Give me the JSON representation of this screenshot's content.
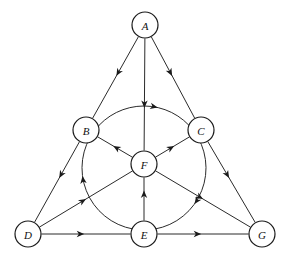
{
  "figure": {
    "background_color": "#ffffff",
    "line_color": "#2b2b2b",
    "node_fill": "#ffffff",
    "node_stroke": "#1a1a1a",
    "arrow_color": "#1a1a1a",
    "width": 287,
    "height": 257
  },
  "nodes": [
    {
      "id": "A",
      "label": "A",
      "x": 145,
      "y": 25,
      "r": 13
    },
    {
      "id": "B",
      "label": "B",
      "x": 86,
      "y": 130,
      "r": 13
    },
    {
      "id": "C",
      "label": "C",
      "x": 201,
      "y": 130,
      "r": 13
    },
    {
      "id": "F",
      "label": "F",
      "x": 144,
      "y": 164,
      "r": 13
    },
    {
      "id": "D",
      "label": "D",
      "x": 28,
      "y": 234,
      "r": 13
    },
    {
      "id": "E",
      "label": "E",
      "x": 144,
      "y": 234,
      "r": 13
    },
    {
      "id": "G",
      "label": "G",
      "x": 262,
      "y": 234,
      "r": 13
    }
  ],
  "edges": [
    {
      "id": "A-B",
      "from": "A",
      "to": "B",
      "kind": "straight",
      "arrow_t": 0.48
    },
    {
      "id": "A-C",
      "from": "A",
      "to": "C",
      "kind": "straight",
      "arrow_t": 0.48
    },
    {
      "id": "A-F",
      "from": "A",
      "to": "F",
      "kind": "straight",
      "arrow_t": 0.62
    },
    {
      "id": "B-D",
      "from": "B",
      "to": "D",
      "kind": "straight",
      "arrow_t": 0.45
    },
    {
      "id": "F-B",
      "from": "F",
      "to": "B",
      "kind": "straight",
      "arrow_t": 0.55
    },
    {
      "id": "F-C",
      "from": "F",
      "to": "C",
      "kind": "straight",
      "arrow_t": 0.55
    },
    {
      "id": "F-G",
      "from": "F",
      "to": "G",
      "kind": "straight",
      "arrow_t": 0.5
    },
    {
      "id": "D-F",
      "from": "D",
      "to": "F",
      "kind": "straight",
      "arrow_t": 0.5
    },
    {
      "id": "E-F",
      "from": "E",
      "to": "F",
      "kind": "straight",
      "arrow_t": 0.7
    },
    {
      "id": "D-E",
      "from": "D",
      "to": "E",
      "kind": "straight",
      "arrow_t": 0.48
    },
    {
      "id": "E-G",
      "from": "E",
      "to": "G",
      "kind": "straight",
      "arrow_t": 0.48
    },
    {
      "id": "C-G",
      "from": "C",
      "to": "G",
      "kind": "straight",
      "arrow_t": 0.45
    },
    {
      "id": "B-C-arc",
      "from": "B",
      "to": "C",
      "kind": "arc",
      "arrow_t": 0.62,
      "note": "upper arc of inscribed circle"
    },
    {
      "id": "C-E-arc",
      "from": "C",
      "to": "E",
      "kind": "arc",
      "arrow_t": 0.62,
      "note": "right-lower arc of inscribed circle"
    },
    {
      "id": "E-D-arc",
      "from": "E",
      "to": "B",
      "kind": "arc",
      "arrow_t": 0.62,
      "note": "left-lower arc of inscribed circle"
    }
  ],
  "circle": {
    "center_x": 144,
    "center_y": 168,
    "radius": 62
  }
}
